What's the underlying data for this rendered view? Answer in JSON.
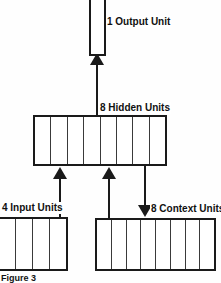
{
  "figure": {
    "caption": "Figure 3",
    "background_color": "#fefefe",
    "line_color": "#1a1a1a"
  },
  "layers": {
    "output": {
      "label": "1 Output Unit",
      "units": 1,
      "box_fill": "#ffffff"
    },
    "hidden": {
      "label": "8 Hidden Units",
      "units": 8,
      "box_fill": "#ffffff"
    },
    "input": {
      "label": "4 Input Units",
      "units": 4,
      "box_fill": "#ffffff"
    },
    "context": {
      "label": "8 Context Units",
      "units": 8,
      "box_fill": "#ffffff"
    }
  },
  "connections": [
    {
      "name": "hidden-to-output",
      "from": "hidden",
      "to": "output",
      "direction": "up",
      "arrowhead": "arrow-up-icon"
    },
    {
      "name": "input-to-hidden",
      "from": "input",
      "to": "hidden",
      "direction": "up",
      "arrowhead": "arrow-up-icon"
    },
    {
      "name": "context-to-hidden",
      "from": "context",
      "to": "hidden",
      "direction": "up",
      "arrowhead": "arrow-up-icon"
    },
    {
      "name": "hidden-to-context",
      "from": "hidden",
      "to": "context",
      "direction": "down",
      "arrowhead": "arrow-down-icon"
    }
  ]
}
